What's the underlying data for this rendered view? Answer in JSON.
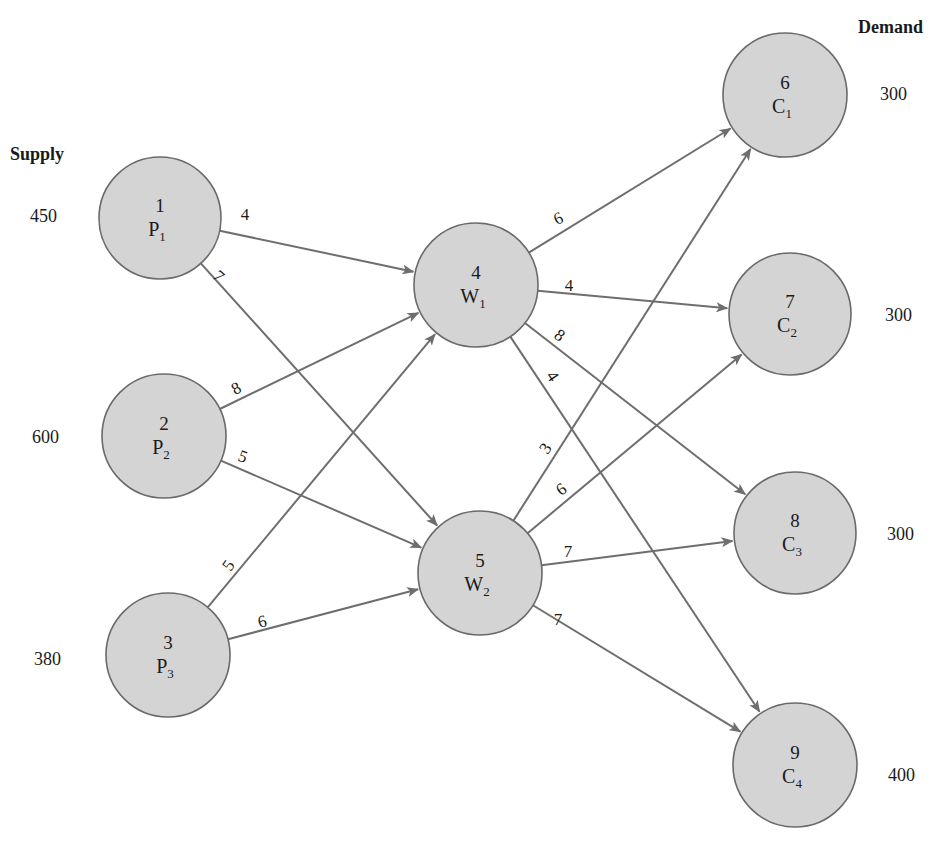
{
  "headers": {
    "supply": "Supply",
    "demand": "Demand"
  },
  "colors": {
    "node_fill": "#d4d4d4",
    "node_stroke": "#6a6a6a",
    "edge": "#6e6e6e",
    "text": "#1a1a1a"
  },
  "nodes": [
    {
      "id": "1",
      "letter": "P",
      "sub": "1",
      "x": 160,
      "y": 218,
      "r": 61
    },
    {
      "id": "2",
      "letter": "P",
      "sub": "2",
      "x": 164,
      "y": 436,
      "r": 62
    },
    {
      "id": "3",
      "letter": "P",
      "sub": "3",
      "x": 168,
      "y": 655,
      "r": 62
    },
    {
      "id": "4",
      "letter": "W",
      "sub": "1",
      "x": 476,
      "y": 285,
      "r": 62
    },
    {
      "id": "5",
      "letter": "W",
      "sub": "2",
      "x": 480,
      "y": 573,
      "r": 62
    },
    {
      "id": "6",
      "letter": "C",
      "sub": "1",
      "x": 785,
      "y": 95,
      "r": 62
    },
    {
      "id": "7",
      "letter": "C",
      "sub": "2",
      "x": 790,
      "y": 314,
      "r": 61
    },
    {
      "id": "8",
      "letter": "C",
      "sub": "3",
      "x": 795,
      "y": 533,
      "r": 61
    },
    {
      "id": "9",
      "letter": "C",
      "sub": "4",
      "x": 795,
      "y": 765,
      "r": 62
    }
  ],
  "supply": [
    {
      "node": "1",
      "value": "450",
      "x": 30,
      "y": 222
    },
    {
      "node": "2",
      "value": "600",
      "x": 32,
      "y": 443
    },
    {
      "node": "3",
      "value": "380",
      "x": 34,
      "y": 665
    }
  ],
  "demand": [
    {
      "node": "6",
      "value": "300",
      "x": 880,
      "y": 100
    },
    {
      "node": "7",
      "value": "300",
      "x": 885,
      "y": 321
    },
    {
      "node": "8",
      "value": "300",
      "x": 887,
      "y": 540
    },
    {
      "node": "9",
      "value": "400",
      "x": 888,
      "y": 781
    }
  ],
  "edges": [
    {
      "from": "1",
      "to": "4",
      "cost": "4",
      "lx": 245,
      "ly": 220,
      "rot": 0
    },
    {
      "from": "1",
      "to": "5",
      "cost": "7",
      "lx": 219,
      "ly": 282,
      "rot": 42
    },
    {
      "from": "2",
      "to": "4",
      "cost": "8",
      "lx": 236,
      "ly": 394,
      "rot": -28
    },
    {
      "from": "2",
      "to": "5",
      "cost": "5",
      "lx": 243,
      "ly": 462,
      "rot": 20
    },
    {
      "from": "3",
      "to": "4",
      "cost": "5",
      "lx": 228,
      "ly": 571,
      "rot": -55
    },
    {
      "from": "3",
      "to": "5",
      "cost": "6",
      "lx": 262,
      "ly": 627,
      "rot": -15
    },
    {
      "from": "4",
      "to": "6",
      "cost": "6",
      "lx": 558,
      "ly": 224,
      "rot": -25
    },
    {
      "from": "4",
      "to": "7",
      "cost": "4",
      "lx": 569,
      "ly": 291,
      "rot": 0
    },
    {
      "from": "4",
      "to": "8",
      "cost": "8",
      "lx": 560,
      "ly": 341,
      "rot": 36
    },
    {
      "from": "4",
      "to": "9",
      "cost": "4",
      "lx": 553,
      "ly": 382,
      "rot": 56
    },
    {
      "from": "5",
      "to": "6",
      "cost": "3",
      "lx": 545,
      "ly": 454,
      "rot": -55
    },
    {
      "from": "5",
      "to": "7",
      "cost": "6",
      "lx": 561,
      "ly": 495,
      "rot": -36
    },
    {
      "from": "5",
      "to": "8",
      "cost": "7",
      "lx": 568,
      "ly": 557,
      "rot": 0
    },
    {
      "from": "5",
      "to": "9",
      "cost": "7",
      "lx": 558,
      "ly": 625,
      "rot": 0
    }
  ]
}
